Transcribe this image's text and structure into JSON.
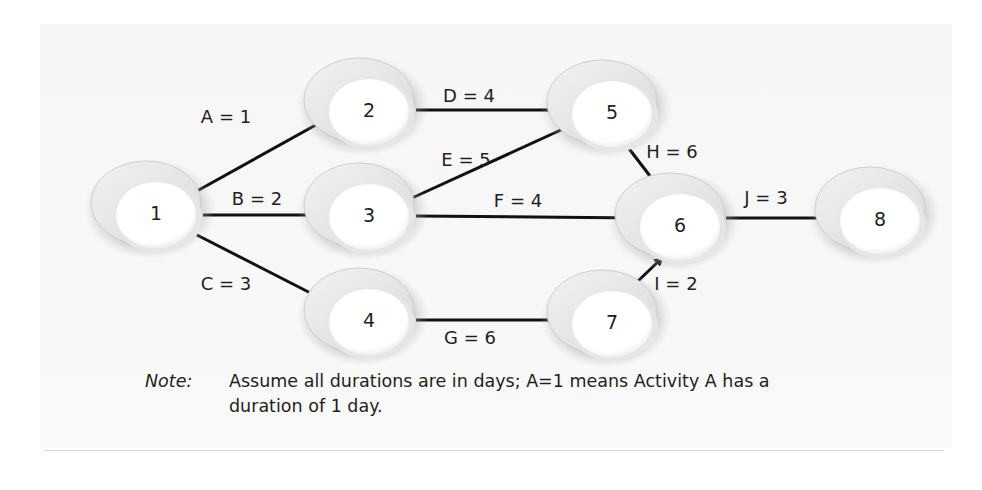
{
  "diagram": {
    "type": "activity-on-arrow network",
    "colors": {
      "panel": "#f7f7f7",
      "node_face": "#ffffff",
      "node_rim": "#e2e2e2",
      "arrow": "#111111",
      "text": "#231f20"
    },
    "nodes": [
      {
        "id": "1",
        "label": "1"
      },
      {
        "id": "2",
        "label": "2"
      },
      {
        "id": "3",
        "label": "3"
      },
      {
        "id": "4",
        "label": "4"
      },
      {
        "id": "5",
        "label": "5"
      },
      {
        "id": "6",
        "label": "6"
      },
      {
        "id": "7",
        "label": "7"
      },
      {
        "id": "8",
        "label": "8"
      }
    ],
    "edges": [
      {
        "activity": "A",
        "duration": 1,
        "from": "1",
        "to": "2",
        "label": "A = 1"
      },
      {
        "activity": "B",
        "duration": 2,
        "from": "1",
        "to": "3",
        "label": "B = 2"
      },
      {
        "activity": "C",
        "duration": 3,
        "from": "1",
        "to": "4",
        "label": "C = 3"
      },
      {
        "activity": "D",
        "duration": 4,
        "from": "2",
        "to": "5",
        "label": "D = 4"
      },
      {
        "activity": "E",
        "duration": 5,
        "from": "3",
        "to": "5",
        "label": "E = 5"
      },
      {
        "activity": "F",
        "duration": 4,
        "from": "3",
        "to": "6",
        "label": "F = 4"
      },
      {
        "activity": "G",
        "duration": 6,
        "from": "4",
        "to": "7",
        "label": "G = 6"
      },
      {
        "activity": "H",
        "duration": 6,
        "from": "5",
        "to": "6",
        "label": "H = 6"
      },
      {
        "activity": "I",
        "duration": 2,
        "from": "7",
        "to": "6",
        "label": "I = 2"
      },
      {
        "activity": "J",
        "duration": 3,
        "from": "6",
        "to": "8",
        "label": "J = 3"
      }
    ]
  },
  "note": {
    "key": "Note:",
    "line1": "Assume all durations are in days; A=1 means Activity A has a",
    "line2": "duration of 1 day."
  }
}
